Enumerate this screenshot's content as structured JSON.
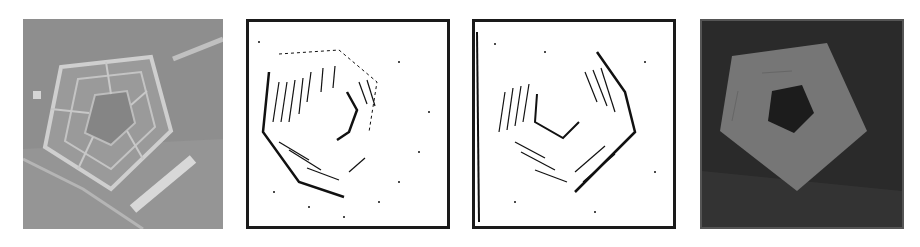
{
  "figure": {
    "panels": [
      {
        "id": "original",
        "description": "Aerial grayscale image of pentagon-shaped building",
        "colors": {
          "ground": "#8c8c8c",
          "building": "#a9a9a9",
          "roads": "#c8c8c8"
        }
      },
      {
        "id": "edge-map-1",
        "description": "Binary edge detection result, black edges on white",
        "colors": {
          "bg": "#ffffff",
          "edges": "#111111"
        }
      },
      {
        "id": "edge-map-2",
        "description": "Binary edge detection result (variant), black edges on white",
        "colors": {
          "bg": "#ffffff",
          "edges": "#111111"
        }
      },
      {
        "id": "segmentation",
        "description": "Segmented pentagon region in mid-gray on dark background",
        "colors": {
          "bg": "#2a2a2a",
          "region": "#777777",
          "hole": "#1c1c1c"
        }
      }
    ]
  }
}
